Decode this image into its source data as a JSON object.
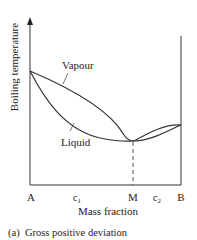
{
  "figure": {
    "caption": "(a)  Gross positive deviation",
    "y_axis_label": "Boiling temperature",
    "x_axis_label": "Mass fraction",
    "curve_labels": {
      "vapour": "Vapour",
      "liquid": "Liquid"
    },
    "x_ticks": {
      "A": "A",
      "c1_base": "c",
      "c1_sub": "1",
      "M": "M",
      "c2_base": "c",
      "c2_sub": "2",
      "B": "B"
    },
    "colors": {
      "line": "#333333",
      "text": "#222222",
      "background": "#ffffff"
    }
  }
}
